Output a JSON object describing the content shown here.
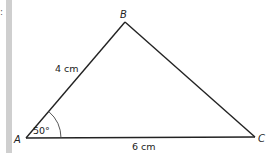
{
  "diagram": {
    "type": "triangle",
    "vertices": [
      {
        "name": "A",
        "label": "A",
        "x": 26,
        "y": 138
      },
      {
        "name": "B",
        "label": "B",
        "x": 125,
        "y": 22
      },
      {
        "name": "C",
        "label": "C",
        "x": 255,
        "y": 137
      }
    ],
    "sides": {
      "AB": {
        "label": "4 cm"
      },
      "AC": {
        "label": "6 cm"
      }
    },
    "angles": {
      "A": {
        "label": "50°"
      }
    },
    "margin_mark": ":",
    "colors": {
      "line": "#222222",
      "side_bar": "#cfcfcf",
      "background": "#ffffff"
    }
  }
}
